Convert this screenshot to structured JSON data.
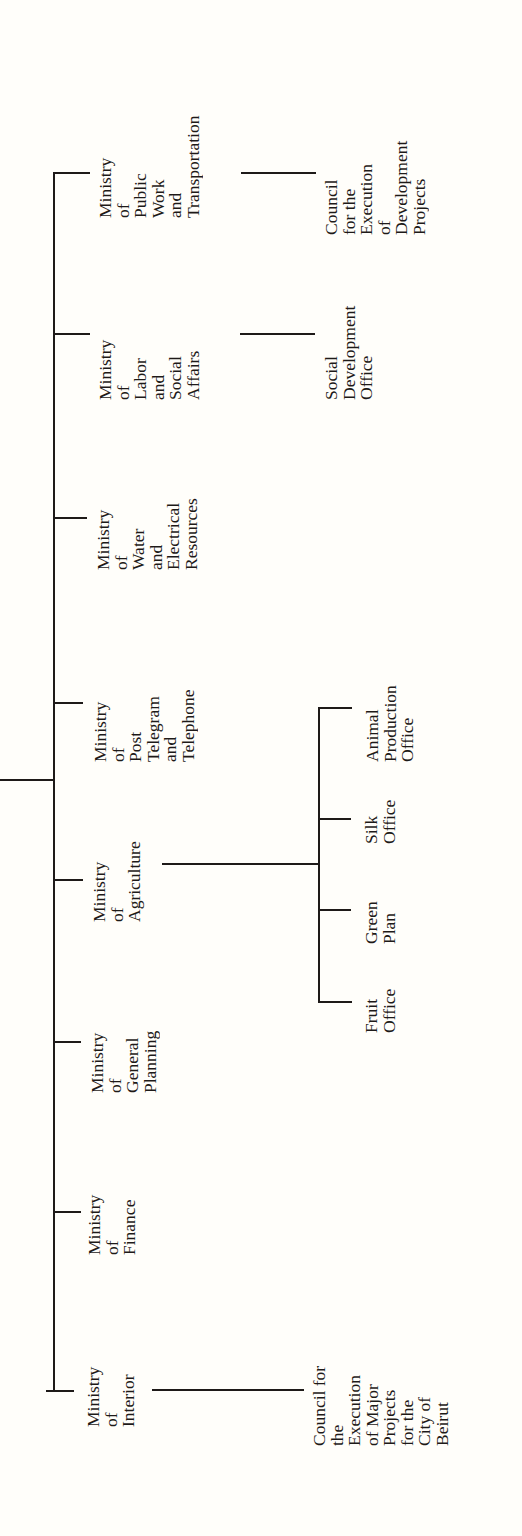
{
  "chart": {
    "orientation": "rotated-90-ccw",
    "line_color": "#1e1a18",
    "background": "#fffefa",
    "ministries": [
      {
        "id": "public-work",
        "lines": [
          "Ministry",
          "of",
          "Public",
          "Work",
          "and",
          "Transportation"
        ],
        "children": [
          {
            "lines": [
              "Council",
              "for the",
              "Execution",
              "of",
              "Development",
              "Projects"
            ]
          }
        ]
      },
      {
        "id": "labor",
        "lines": [
          "Ministry",
          "of",
          "Labor",
          "and",
          "Social",
          "Affairs"
        ],
        "children": [
          {
            "lines": [
              "Social",
              "Development",
              "Office"
            ]
          }
        ]
      },
      {
        "id": "water",
        "lines": [
          "Ministry",
          "of",
          "Water",
          "and",
          "Electrical",
          "Resources"
        ],
        "children": []
      },
      {
        "id": "post",
        "lines": [
          "Ministry",
          "of",
          "Post",
          "Telegram",
          "and",
          "Telephone"
        ],
        "children": []
      },
      {
        "id": "agriculture",
        "lines": [
          "Ministry",
          "of",
          "Agriculture"
        ],
        "children": [
          {
            "lines": [
              "Animal",
              "Production",
              "Office"
            ]
          },
          {
            "lines": [
              "Silk",
              "Office"
            ]
          },
          {
            "lines": [
              "Green",
              "Plan"
            ]
          },
          {
            "lines": [
              "Fruit",
              "Office"
            ]
          }
        ]
      },
      {
        "id": "planning",
        "lines": [
          "Ministry",
          "of",
          "General",
          "Planning"
        ],
        "children": []
      },
      {
        "id": "finance",
        "lines": [
          "Ministry",
          "of",
          "Finance"
        ],
        "children": []
      },
      {
        "id": "interior",
        "lines": [
          "Ministry",
          "of",
          "Interior"
        ],
        "children": [
          {
            "lines": [
              "Council for",
              "the",
              "Execution",
              "of Major",
              "Projects",
              "for the",
              "City of",
              "Beirut"
            ]
          }
        ]
      }
    ]
  }
}
